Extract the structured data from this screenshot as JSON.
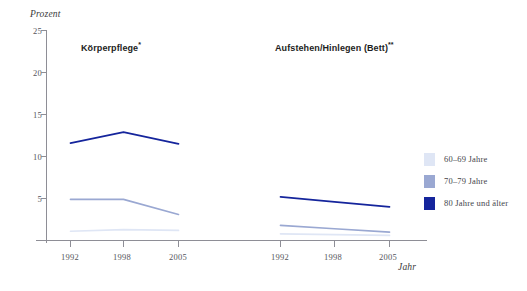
{
  "axes": {
    "y_axis_title": "Prozent",
    "x_axis_title": "Jahr",
    "y_ticks": [
      "25",
      "20",
      "15",
      "10",
      "5"
    ],
    "x_ticks": [
      "1992",
      "1998",
      "2005"
    ]
  },
  "panels": [
    {
      "title": "Körperpflege",
      "marker": "*"
    },
    {
      "title": "Aufstehen/Hinlegen (Bett)",
      "marker": "**"
    }
  ],
  "legend": {
    "items": [
      {
        "label": "60–69 Jahre",
        "color": "#dfe6f5"
      },
      {
        "label": "70–79 Jahre",
        "color": "#9aa8d2"
      },
      {
        "label": "80 Jahre und älter",
        "color": "#15259c"
      }
    ]
  },
  "chart_data": {
    "type": "line",
    "title": "",
    "xlabel": "Jahr",
    "ylabel": "Prozent",
    "ylim": [
      0,
      25
    ],
    "yticks": [
      5,
      10,
      15,
      20,
      25
    ],
    "grid": false,
    "legend_position": "right",
    "x": [
      "1992",
      "1998",
      "2005"
    ],
    "panels": [
      {
        "name": "Körperpflege*",
        "series": [
          {
            "name": "60–69 Jahre",
            "color": "#dfe6f5",
            "values": [
              1.1,
              1.3,
              1.2
            ]
          },
          {
            "name": "70–79 Jahre",
            "color": "#9aa8d2",
            "values": [
              4.9,
              4.9,
              3.1
            ]
          },
          {
            "name": "80 Jahre und älter",
            "color": "#15259c",
            "values": [
              11.6,
              12.9,
              11.5
            ]
          }
        ]
      },
      {
        "name": "Aufstehen/Hinlegen (Bett)**",
        "series": [
          {
            "name": "60–69 Jahre",
            "color": "#dfe6f5",
            "values": [
              0.8,
              0.7,
              0.6
            ]
          },
          {
            "name": "70–79 Jahre",
            "color": "#9aa8d2",
            "values": [
              1.8,
              1.4,
              1.0
            ]
          },
          {
            "name": "80 Jahre und älter",
            "color": "#15259c",
            "values": [
              5.2,
              4.6,
              4.0
            ]
          }
        ]
      }
    ]
  }
}
